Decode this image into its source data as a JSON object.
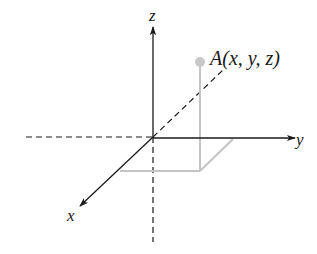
{
  "diagram": {
    "colors": {
      "axis": "#1a1a1a",
      "projection": "#c4c4c4",
      "point": "#c8c8c8",
      "background": "#ffffff"
    },
    "axes": {
      "x_label": "x",
      "y_label": "y",
      "z_label": "z"
    },
    "point": {
      "label": "A(x, y, z)"
    }
  }
}
